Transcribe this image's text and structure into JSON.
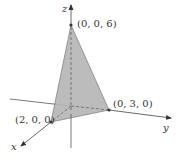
{
  "diagram": {
    "type": "3d-coordinate-plane-triangle",
    "axes": {
      "x": {
        "label": "x"
      },
      "y": {
        "label": "y"
      },
      "z": {
        "label": "z"
      }
    },
    "vertices": [
      {
        "label": "(0, 0, 6)",
        "coords": [
          0,
          0,
          6
        ]
      },
      {
        "label": "(0, 3, 0)",
        "coords": [
          0,
          3,
          0
        ]
      },
      {
        "label": "(2, 0, 0)",
        "coords": [
          2,
          0,
          0
        ]
      }
    ],
    "colors": {
      "fill": "#b3b3b3",
      "axis": "#444444",
      "point": "#333333",
      "text": "#333333"
    }
  }
}
